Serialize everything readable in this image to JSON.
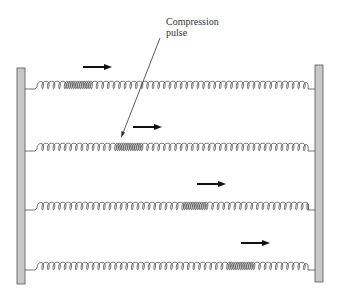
{
  "annotation": {
    "line1": "Compression",
    "line2": "pulse"
  },
  "colors": {
    "wall_fill": "#c8c8c8",
    "wall_stroke": "#555555",
    "spring": "#333333",
    "arrow": "#111111"
  },
  "springs": [
    {
      "y": 89,
      "arrow_x": 83,
      "arrow_y": 67,
      "pulse_start": 0.1,
      "pulse_end": 0.2
    },
    {
      "y": 151,
      "arrow_x": 133,
      "arrow_y": 127,
      "pulse_start": 0.29,
      "pulse_end": 0.39
    },
    {
      "y": 210,
      "arrow_x": 197,
      "arrow_y": 184,
      "pulse_start": 0.53,
      "pulse_end": 0.63
    },
    {
      "y": 270,
      "arrow_x": 241,
      "arrow_y": 243,
      "pulse_start": 0.71,
      "pulse_end": 0.81
    }
  ]
}
